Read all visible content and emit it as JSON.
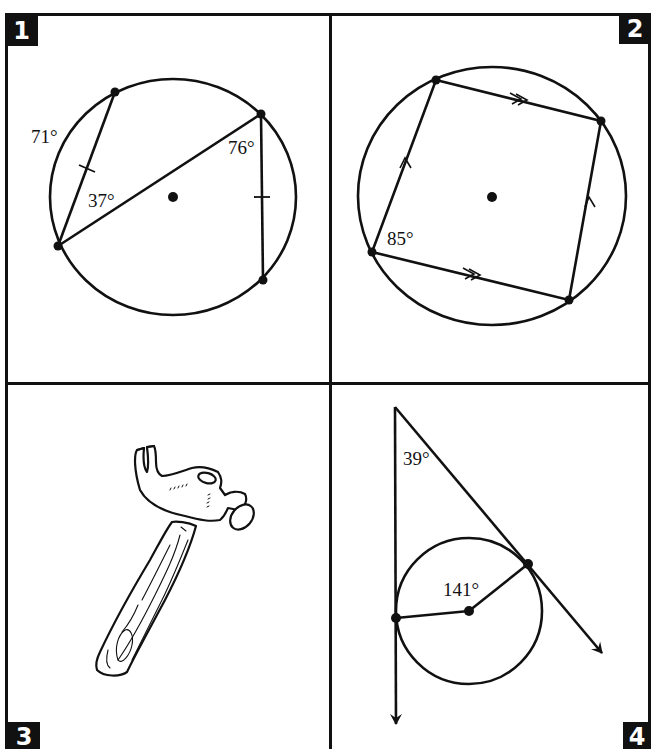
{
  "page": {
    "title_partial": "",
    "stroke_color": "#111111",
    "background": "#ffffff"
  },
  "panels": [
    {
      "number": "1",
      "type": "circle-inscribed-angles",
      "labels": [
        "71°",
        "37°",
        "76°"
      ],
      "arc_label": "71°",
      "inscribed_angle_left": "37°",
      "inscribed_angle_right": "76°",
      "congruent_chord_marks": 2
    },
    {
      "number": "2",
      "type": "cyclic-quadrilateral",
      "labels": [
        "85°"
      ],
      "angle_label": "85°",
      "parallel_marks": {
        "single_arrow_pairs": 1,
        "double_arrow_pairs": 1
      }
    },
    {
      "number": "3",
      "type": "illustration",
      "subject": "claw-hammer"
    },
    {
      "number": "4",
      "type": "tangents-to-circle",
      "labels": [
        "39°",
        "141°"
      ],
      "exterior_angle": "39°",
      "central_angle": "141°"
    }
  ]
}
